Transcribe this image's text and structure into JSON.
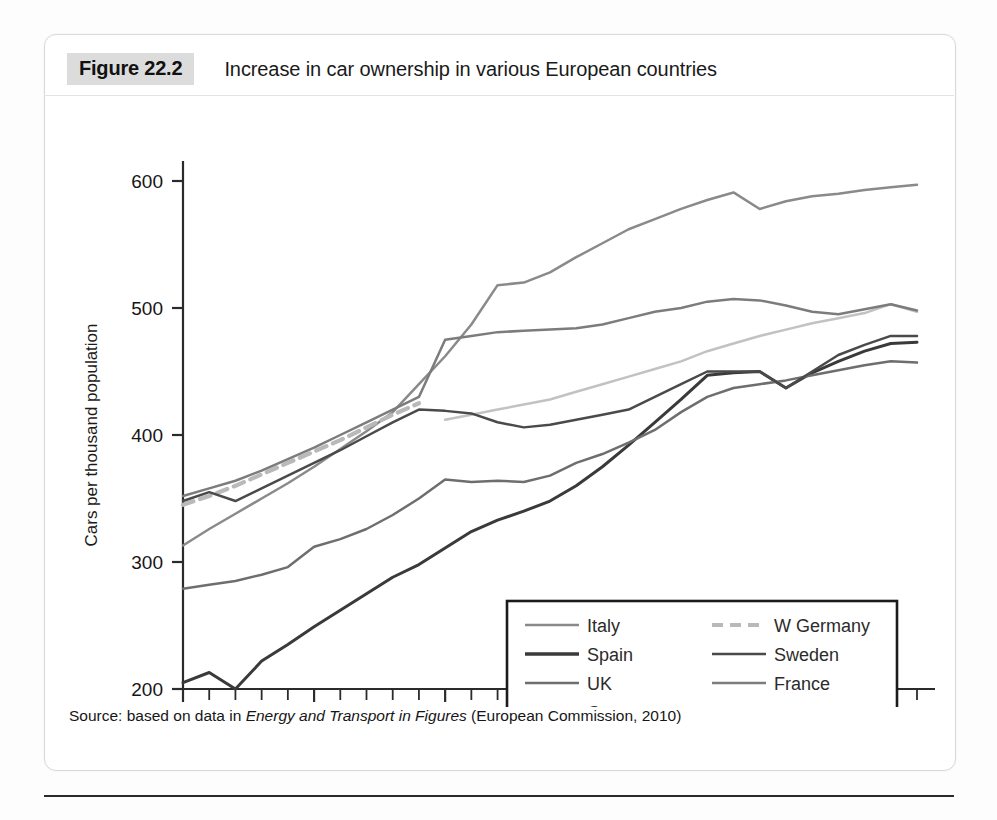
{
  "figure": {
    "badge": "Figure 22.2",
    "title": "Increase in car ownership in various European countries",
    "source_prefix": "Source: based on data in ",
    "source_italic": "Energy and Transport in Figures",
    "source_suffix": " (European Commission, 2010)"
  },
  "axes": {
    "y_title": "Cars per thousand population",
    "y_ticks": [
      "200",
      "300",
      "400",
      "500",
      "600"
    ],
    "x_ticks_major": [
      "1980",
      "1985",
      "1990",
      "1995",
      "2000",
      "2005"
    ]
  },
  "legend": {
    "left_column": [
      "Italy",
      "Spain",
      "UK",
      "Germany"
    ],
    "right_column": [
      "W Germany",
      "Sweden",
      "France"
    ]
  },
  "colors": {
    "italy": "#8a8a8a",
    "spain": "#3a3a3a",
    "uk": "#6e6e6e",
    "germany": "#c2c2c2",
    "w_germany": "#b9b9b9",
    "sweden": "#4a4a4a",
    "france": "#7c7c7c",
    "axis": "#2b2b2b",
    "badge_bg": "#dcdcdc",
    "panel_border": "#d9d9d9"
  },
  "chart_data": {
    "type": "line",
    "title": "Increase in car ownership in various European countries",
    "xlabel": "",
    "ylabel": "Cars per thousand population",
    "xlim": [
      1980,
      2008
    ],
    "ylim": [
      200,
      600
    ],
    "grid": false,
    "legend_position": "inside-lower-right",
    "x": [
      1980,
      1981,
      1982,
      1983,
      1984,
      1985,
      1986,
      1987,
      1988,
      1989,
      1990,
      1991,
      1992,
      1993,
      1994,
      1995,
      1996,
      1997,
      1998,
      1999,
      2000,
      2001,
      2002,
      2003,
      2004,
      2005,
      2006,
      2007,
      2008
    ],
    "series": [
      {
        "name": "Italy",
        "color": "#8a8a8a",
        "style": "solid",
        "values": [
          313,
          326,
          338,
          350,
          362,
          375,
          389,
          403,
          418,
          440,
          462,
          487,
          518,
          520,
          528,
          540,
          551,
          562,
          570,
          578,
          585,
          591,
          578,
          584,
          588,
          590,
          593,
          595,
          597
        ]
      },
      {
        "name": "Spain",
        "color": "#3a3a3a",
        "style": "solid",
        "values": [
          205,
          213,
          200,
          222,
          235,
          249,
          262,
          275,
          288,
          298,
          311,
          324,
          333,
          340,
          348,
          360,
          375,
          392,
          410,
          428,
          447,
          449,
          450,
          437,
          449,
          458,
          466,
          472,
          473
        ]
      },
      {
        "name": "UK",
        "color": "#6e6e6e",
        "style": "solid",
        "values": [
          279,
          282,
          285,
          290,
          296,
          312,
          318,
          326,
          337,
          350,
          365,
          363,
          364,
          363,
          368,
          378,
          385,
          394,
          404,
          418,
          430,
          437,
          440,
          443,
          447,
          451,
          455,
          458,
          457
        ]
      },
      {
        "name": "Germany",
        "color": "#c2c2c2",
        "style": "solid",
        "values": [
          null,
          null,
          null,
          null,
          null,
          null,
          null,
          null,
          null,
          null,
          412,
          416,
          420,
          424,
          428,
          434,
          440,
          446,
          452,
          458,
          466,
          472,
          478,
          483,
          488,
          492,
          496,
          503,
          497
        ]
      },
      {
        "name": "W Germany",
        "color": "#b9b9b9",
        "style": "dashed",
        "values": [
          345,
          352,
          360,
          369,
          378,
          387,
          396,
          406,
          416,
          425,
          null,
          null,
          null,
          null,
          null,
          null,
          null,
          null,
          null,
          null,
          null,
          null,
          null,
          null,
          null,
          null,
          null,
          null,
          null
        ]
      },
      {
        "name": "Sweden",
        "color": "#4a4a4a",
        "style": "solid",
        "values": [
          348,
          355,
          348,
          358,
          368,
          378,
          388,
          399,
          410,
          420,
          419,
          417,
          410,
          406,
          408,
          412,
          416,
          420,
          430,
          440,
          450,
          450,
          450,
          437,
          450,
          463,
          471,
          478,
          478
        ]
      },
      {
        "name": "France",
        "color": "#7c7c7c",
        "style": "solid",
        "values": [
          352,
          358,
          364,
          372,
          381,
          390,
          400,
          410,
          420,
          430,
          475,
          478,
          481,
          482,
          483,
          484,
          487,
          492,
          497,
          500,
          505,
          507,
          506,
          502,
          497,
          495,
          499,
          503,
          498
        ]
      }
    ]
  }
}
